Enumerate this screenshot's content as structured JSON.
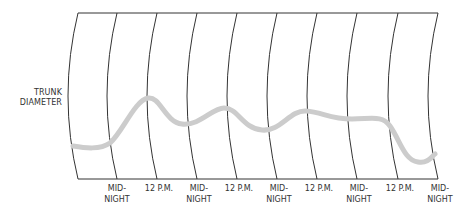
{
  "diagram": {
    "y_axis_label": [
      "TRUNK",
      "DIAMETER"
    ],
    "x_axis_labels": [
      {
        "lines": [
          "MID-",
          "NIGHT"
        ]
      },
      {
        "lines": [
          "12 P.M."
        ]
      },
      {
        "lines": [
          "MID-",
          "NIGHT"
        ]
      },
      {
        "lines": [
          "12 P.M."
        ]
      },
      {
        "lines": [
          "MID-",
          "NIGHT"
        ]
      },
      {
        "lines": [
          "12 P.M."
        ]
      },
      {
        "lines": [
          "MID-",
          "NIGHT"
        ]
      },
      {
        "lines": [
          "12 P.M."
        ]
      },
      {
        "lines": [
          "MID-",
          "NIGHT"
        ]
      }
    ],
    "colors": {
      "grid_line": "#333333",
      "curve": "#cccccc",
      "text": "#333333"
    }
  }
}
